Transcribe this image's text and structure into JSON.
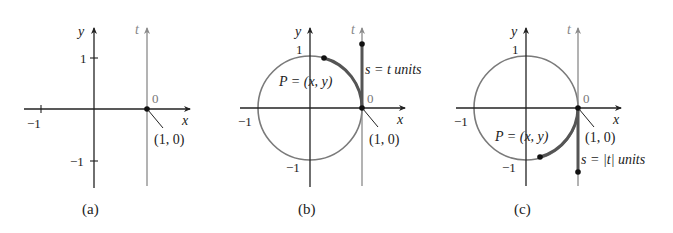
{
  "figure": {
    "colors": {
      "axis": "#222222",
      "t_axis": "#8a8a8a",
      "circle": "#7a7a7a",
      "highlight": "#555555",
      "text": "#222222",
      "zero_label": "#777777"
    },
    "panels": [
      {
        "id": "a",
        "caption": "(a)",
        "axis_labels": {
          "x": "x",
          "y": "y",
          "t": "t"
        },
        "ticks": {
          "y_pos": "1",
          "y_neg": "−1",
          "x_neg": "−1"
        },
        "origin_t_label": "0",
        "point_label": "(1, 0)",
        "show_circle": false
      },
      {
        "id": "b",
        "caption": "(b)",
        "axis_labels": {
          "x": "x",
          "y": "y",
          "t": "t"
        },
        "ticks": {
          "y_pos": "1",
          "y_neg": "−1",
          "x_neg": "−1"
        },
        "origin_t_label": "0",
        "point_label": "(1, 0)",
        "show_circle": true,
        "P_label": "P = (x, y)",
        "arc_label": "s = t units",
        "direction": "positive t (counterclockwise)"
      },
      {
        "id": "c",
        "caption": "(c)",
        "axis_labels": {
          "x": "x",
          "y": "y",
          "t": "t"
        },
        "ticks": {
          "y_pos": "1",
          "y_neg": "−1",
          "x_neg": "−1"
        },
        "origin_t_label": "0",
        "point_label": "(1, 0)",
        "show_circle": true,
        "P_label": "P = (x, y)",
        "arc_label": "s = |t| units",
        "direction": "negative t (clockwise)"
      }
    ]
  }
}
